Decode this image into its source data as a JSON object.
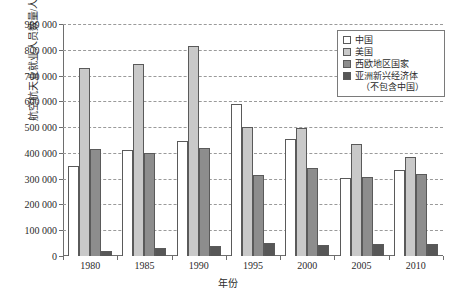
{
  "chart_data": {
    "type": "bar",
    "title": "",
    "xlabel": "年份",
    "ylabel": "航空航天业就业人员数量/人",
    "categories": [
      "1980",
      "1985",
      "1990",
      "1995",
      "2000",
      "2005",
      "2010"
    ],
    "series": [
      {
        "name": "中国",
        "color": "#ffffff",
        "values": [
          350000,
          410000,
          445000,
          590000,
          455000,
          303000,
          333000
        ]
      },
      {
        "name": "美国",
        "color": "#c9c9c9",
        "values": [
          730000,
          745000,
          815000,
          500000,
          495000,
          435000,
          385000
        ]
      },
      {
        "name": "西欧地区国家",
        "color": "#8d8d8d",
        "values": [
          415000,
          400000,
          418000,
          315000,
          340000,
          307000,
          320000
        ]
      },
      {
        "name": "亚洲新兴经济体（不包含中国）",
        "color": "#575757",
        "values": [
          20000,
          33000,
          40000,
          50000,
          42000,
          45000,
          48000
        ]
      }
    ],
    "ylim": [
      0,
      900000
    ],
    "ytick_values": [
      0,
      100000,
      200000,
      300000,
      400000,
      500000,
      600000,
      700000,
      800000,
      900000
    ],
    "ytick_labels": [
      "0",
      "100 000",
      "200 000",
      "300 000",
      "400 000",
      "500 000",
      "600 000",
      "700 000",
      "800 000",
      "900 000"
    ],
    "grid": true,
    "grid_style": "dashed",
    "legend_position": "top-right",
    "legend_entries": [
      {
        "label": "中国",
        "sub": "",
        "color": "#ffffff"
      },
      {
        "label": "美国",
        "sub": "",
        "color": "#c9c9c9"
      },
      {
        "label": "西欧地区国家",
        "sub": "",
        "color": "#8d8d8d"
      },
      {
        "label": "亚洲新兴经济体",
        "sub": "（不包含中国）",
        "color": "#575757"
      }
    ]
  }
}
